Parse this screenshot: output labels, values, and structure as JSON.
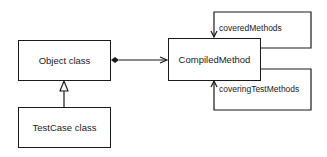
{
  "diagram": {
    "nodes": [
      {
        "id": "object-class",
        "label": "Object class"
      },
      {
        "id": "testcase-class",
        "label": "TestCase class"
      },
      {
        "id": "compiled-method",
        "label": "CompiledMethod"
      }
    ],
    "edges": [
      {
        "from": "testcase-class",
        "to": "object-class",
        "type": "inheritance"
      },
      {
        "from": "object-class",
        "to": "compiled-method",
        "type": "composition"
      },
      {
        "from": "compiled-method",
        "to": "compiled-method",
        "label": "coveredMethods"
      },
      {
        "from": "compiled-method",
        "to": "compiled-method",
        "label": "coveringTestMethods"
      }
    ],
    "labels": {
      "covered": "coveredMethods",
      "covering": "coveringTestMethods"
    },
    "colors": {
      "stroke": "#1a1a1a",
      "background": "#ffffff"
    }
  }
}
